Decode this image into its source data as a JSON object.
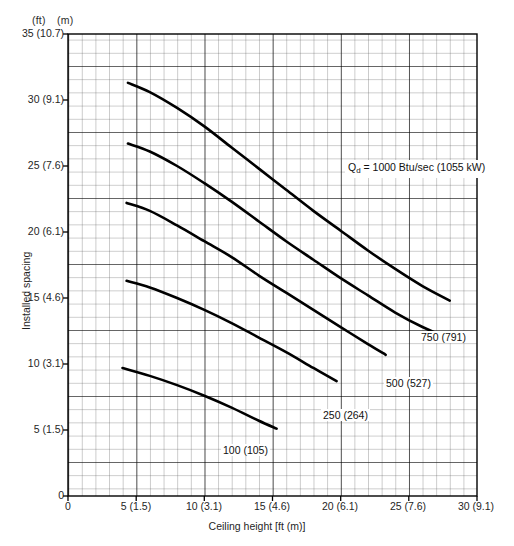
{
  "figure": {
    "unit_header_ft": "(ft)",
    "unit_header_m": "(m)",
    "caption": ""
  },
  "chart_data": {
    "type": "line",
    "title": "",
    "xlabel": "Ceiling height [ft (m)]",
    "ylabel": "Installed spacing",
    "xlim": [
      0,
      30
    ],
    "ylim": [
      0,
      35
    ],
    "grid": true,
    "grid_minor_per_major": 5,
    "legend_position": "inline-labels",
    "x_unit_header": "(ft)",
    "y_unit_header": "(m)",
    "xticks": [
      0,
      5,
      10,
      15,
      20,
      25,
      30
    ],
    "xticklabels": [
      "0",
      "5 (1.5)",
      "10 (3.1)",
      "15 (4.6)",
      "20 (6.1)",
      "25 (7.6)",
      "30 (9.1)"
    ],
    "yticks": [
      0,
      5,
      10,
      15,
      20,
      25,
      30,
      35
    ],
    "yticklabels": [
      "0",
      "5 (1.5)",
      "10 (3.1)",
      "15 (4.6)",
      "20 (6.1)",
      "25 (7.6)",
      "30 (9.1)",
      "35 (10.7)"
    ],
    "annotation_qd": "Q_d = 1000 Btu/sec (1055 kW)",
    "annotation_qd_parts": {
      "symbol": "Q",
      "subscript": "d",
      "rest": " = 1000 Btu/sec (1055 kW)"
    },
    "series": [
      {
        "name": "1000 (1055 kW)",
        "label": "Q_d = 1000 Btu/sec (1055 kW)",
        "heat_release_btu_sec": 1000,
        "heat_release_kw": 1055,
        "x": [
          4.4,
          6.0,
          8.0,
          10.0,
          12.0,
          14.0,
          16.0,
          18.0,
          20.0,
          22.0,
          24.0,
          26.0,
          28.0
        ],
        "y": [
          31.3,
          30.6,
          29.4,
          28.0,
          26.4,
          24.8,
          23.2,
          21.6,
          20.1,
          18.6,
          17.2,
          15.9,
          14.8
        ]
      },
      {
        "name": "750 (791)",
        "label": "750 (791)",
        "heat_release_btu_sec": 750,
        "heat_release_kw": 791,
        "x": [
          4.4,
          6.0,
          8.0,
          10.0,
          12.0,
          14.0,
          16.0,
          18.0,
          20.0,
          22.0,
          24.0,
          26.0,
          28.0
        ],
        "y": [
          26.7,
          26.1,
          25.0,
          23.7,
          22.3,
          20.8,
          19.3,
          17.9,
          16.5,
          15.2,
          13.9,
          12.8,
          11.9
        ]
      },
      {
        "name": "500 (527)",
        "label": "500 (527)",
        "heat_release_btu_sec": 500,
        "heat_release_kw": 527,
        "x": [
          4.3,
          6.0,
          8.0,
          10.0,
          12.0,
          14.0,
          16.0,
          18.0,
          20.0,
          22.0,
          23.3
        ],
        "y": [
          22.2,
          21.6,
          20.5,
          19.3,
          18.1,
          16.7,
          15.4,
          14.1,
          12.8,
          11.5,
          10.7
        ]
      },
      {
        "name": "250 (264)",
        "label": "250 (264)",
        "heat_release_btu_sec": 250,
        "heat_release_kw": 264,
        "x": [
          4.3,
          6.0,
          8.0,
          10.0,
          12.0,
          14.0,
          16.0,
          18.0,
          19.7
        ],
        "y": [
          16.3,
          15.8,
          15.0,
          14.1,
          13.1,
          12.0,
          10.9,
          9.7,
          8.7
        ]
      },
      {
        "name": "100 (105)",
        "label": "100 (105)",
        "heat_release_btu_sec": 100,
        "heat_release_kw": 105,
        "x": [
          4.0,
          6.0,
          8.0,
          10.0,
          12.0,
          14.0,
          15.3
        ],
        "y": [
          9.7,
          9.1,
          8.4,
          7.6,
          6.7,
          5.7,
          5.1
        ]
      }
    ],
    "curve_labels": [
      {
        "text": "Q_d = 1000 Btu/sec (1055 kW)",
        "x": 20.0,
        "y": 26.0
      },
      {
        "text": "750 (791)",
        "x": 26.2,
        "y": 12.6
      },
      {
        "text": "500 (527)",
        "x": 22.6,
        "y": 8.8
      },
      {
        "text": "250 (264)",
        "x": 18.6,
        "y": 6.5
      },
      {
        "text": "100 (105)",
        "x": 13.5,
        "y": 3.1
      }
    ]
  }
}
